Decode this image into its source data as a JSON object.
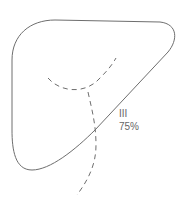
{
  "diagram": {
    "segment_label": "III",
    "percentage": "75%",
    "colors": {
      "outline": "#6e6e6e",
      "dashed": "#6e6e6e",
      "text": "#666666"
    }
  }
}
